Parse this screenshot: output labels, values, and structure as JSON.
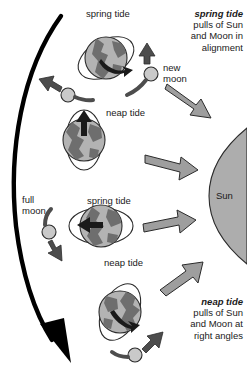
{
  "diagram": {
    "background_color": "#ffffff",
    "ink_color": "#1a1a1a",
    "earth_fill": "#b3b3b3",
    "earth_land": "#6e6e6e",
    "moon_fill": "#c9c9c9",
    "sun_fill": "#adadad",
    "gray_arrow_fill": "#9e9e9e",
    "dark_arrow_fill": "#4d4d4d",
    "orbit_arrow_color": "#000000"
  },
  "callouts": {
    "spring": {
      "heading": "spring tide",
      "line1": "pulls of Sun",
      "line2": "and Moon in",
      "line3": "alignment"
    },
    "neap": {
      "heading": "neap tide",
      "line1": "pulls of Sun",
      "line2": "and Moon at",
      "line3": "right angles"
    }
  },
  "tide_labels": [
    {
      "id": "spring-top",
      "text": "spring tide"
    },
    {
      "id": "neap-upper",
      "text": "neap tide"
    },
    {
      "id": "spring-left",
      "text": "spring tide"
    },
    {
      "id": "neap-lower",
      "text": "neap tide"
    }
  ],
  "moon_labels": {
    "new_moon_line1": "new",
    "new_moon_line2": "moon",
    "full_moon_line1": "full",
    "full_moon_line2": "moon"
  },
  "sun": {
    "label": "Sun"
  },
  "positions": [
    {
      "id": "position-1-new-moon",
      "tide": "spring tide",
      "moon_phase": "new moon",
      "bulge_orientation": "diagonal toward Sun/Moon (aligned)"
    },
    {
      "id": "position-2-first-quarter",
      "tide": "neap tide",
      "moon_phase": "quarter",
      "bulge_orientation": "vertical (perpendicular to Sun)"
    },
    {
      "id": "position-3-full-moon",
      "tide": "spring tide",
      "moon_phase": "full moon",
      "bulge_orientation": "horizontal (aligned with Sun)"
    },
    {
      "id": "position-4-last-quarter",
      "tide": "neap tide",
      "moon_phase": "quarter",
      "bulge_orientation": "diagonal (perpendicular to Sun)"
    }
  ]
}
